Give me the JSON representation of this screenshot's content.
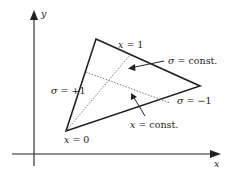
{
  "axes": {
    "x_label": "x",
    "y_label": "y"
  },
  "labels": {
    "x_eq_1": "x = 1",
    "x_eq_0": "x = 0",
    "sigma_plus": "σ = +1",
    "sigma_minus": "σ = −1",
    "sigma_const": "σ = const.",
    "x_const": "x = const."
  },
  "colors": {
    "stroke": "#222222",
    "dotted": "#555555",
    "background": "#ffffff"
  }
}
